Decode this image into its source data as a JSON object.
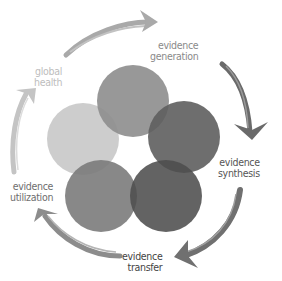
{
  "diagram": {
    "type": "cycle",
    "circles": [
      {
        "id": "top",
        "cx": 133,
        "cy": 101,
        "r": 36,
        "color": "#8f8f8f",
        "opacity": 0.92
      },
      {
        "id": "right",
        "cx": 184,
        "cy": 137,
        "r": 36,
        "color": "#5e5e5e",
        "opacity": 0.92
      },
      {
        "id": "left",
        "cx": 83,
        "cy": 139,
        "r": 36,
        "color": "#c9c9c9",
        "opacity": 0.92
      },
      {
        "id": "bottom-left",
        "cx": 101,
        "cy": 196,
        "r": 36,
        "color": "#7b7b7b",
        "opacity": 0.9
      },
      {
        "id": "bottom-right",
        "cx": 166,
        "cy": 196,
        "r": 36,
        "color": "#4d4d4d",
        "opacity": 0.88
      }
    ],
    "stages": [
      {
        "line1": "evidence",
        "line2": "generation",
        "color": "#8a8a8a"
      },
      {
        "line1": "evidence",
        "line2": "synthesis",
        "color": "#555555"
      },
      {
        "line1": "evidence",
        "line2": "transfer",
        "color": "#444444"
      },
      {
        "line1": "evidence",
        "line2": "utilization",
        "color": "#6e6e6e"
      },
      {
        "line1": "global",
        "line2": "health",
        "color": "#bdbdbd"
      }
    ],
    "arrow_colors": {
      "top": "#a9a9a9",
      "right": "#6a6a6a",
      "bottom": "#6f6f6f",
      "left_lower": "#8c8c8c",
      "left_upper": "#c4c4c4"
    }
  }
}
